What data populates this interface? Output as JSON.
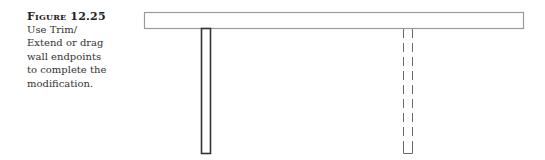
{
  "caption": {
    "label": "Figure 12.25",
    "lines": [
      "Use Trim/",
      "Extend or drag",
      "wall endpoints",
      "to complete the",
      "modification."
    ]
  },
  "drawing": {
    "horizontal_wall": {
      "x": 144,
      "y": 12,
      "width": 379,
      "height": 16,
      "stroke": "#9a9a9a"
    },
    "solid_wall": {
      "x": 201,
      "y": 28,
      "width": 10,
      "height": 125,
      "stroke": "#333333"
    },
    "dashed_wall": {
      "x": 403,
      "y": 28,
      "width": 9,
      "height": 125,
      "stroke": "#6a6a6a"
    }
  }
}
